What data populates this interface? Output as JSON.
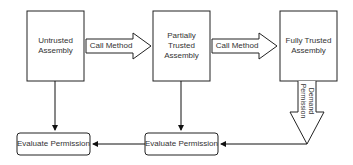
{
  "diagram": {
    "nodes": [
      {
        "id": "untrusted",
        "label": "Untrusted Assembly"
      },
      {
        "id": "partial",
        "label": "Partially Trusted Assembly"
      },
      {
        "id": "full",
        "label": "Fully Trusted Assembly"
      },
      {
        "id": "eval_left",
        "label": "Evaluate Permission"
      },
      {
        "id": "eval_mid",
        "label": "Evaluate Permission"
      }
    ],
    "edges": [
      {
        "from": "untrusted",
        "to": "partial",
        "label": "Call Method"
      },
      {
        "from": "partial",
        "to": "full",
        "label": "Call Method"
      },
      {
        "from": "full",
        "to": "eval_mid",
        "label": "Demand Permission"
      },
      {
        "from": "untrusted",
        "to": "eval_left",
        "label": ""
      },
      {
        "from": "partial",
        "to": "eval_mid",
        "label": ""
      },
      {
        "from": "eval_mid",
        "to": "eval_left",
        "label": ""
      }
    ],
    "labels": {
      "box1": "Untrusted Assembly",
      "box2": "Partially Trusted Assembly",
      "box3": "Fully Trusted Assembly",
      "arrow1": "Call Method",
      "arrow2": "Call Method",
      "demand": "Demand Permission",
      "eval_left": "Evaluate Permission",
      "eval_mid": "Evaluate Permission"
    }
  }
}
